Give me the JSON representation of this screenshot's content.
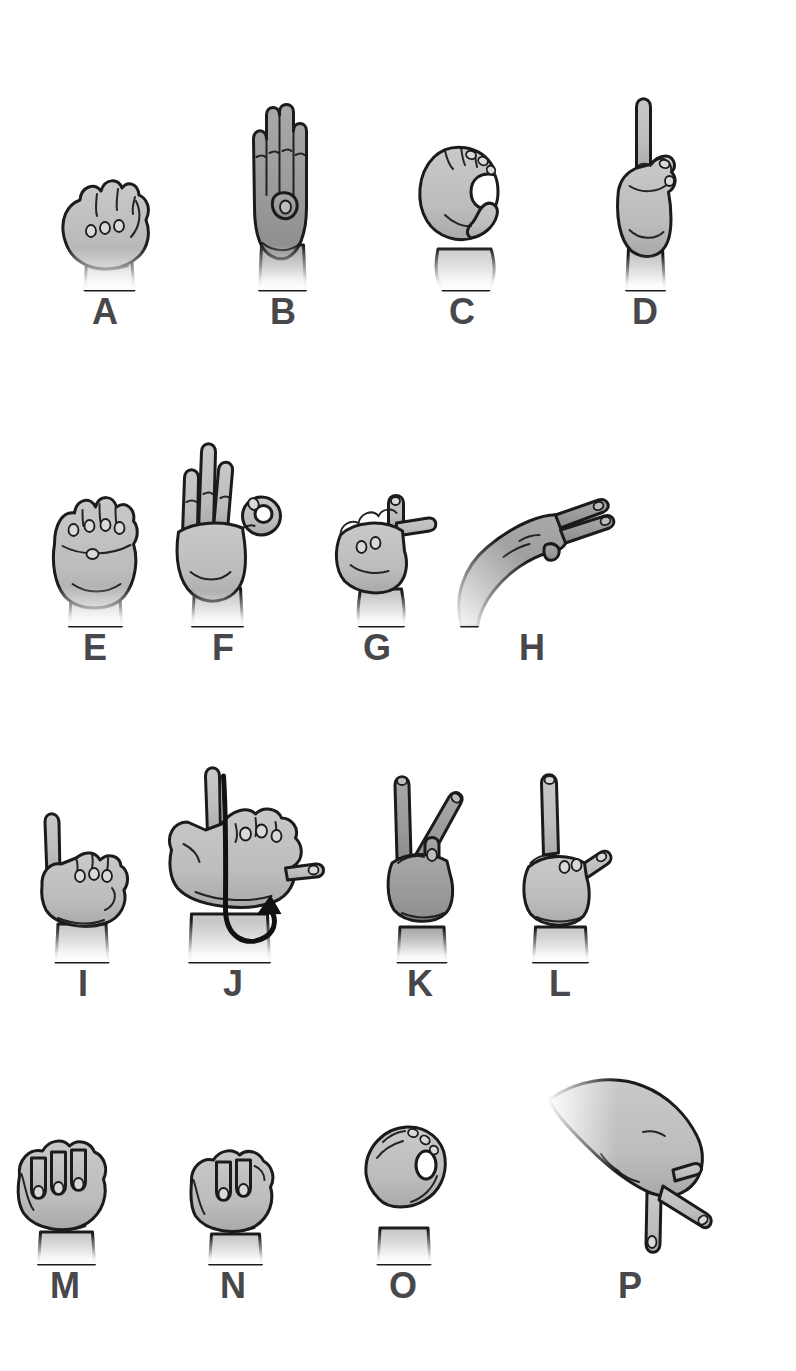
{
  "figure": {
    "kind": "fingerspelling-hand-sign-chart",
    "letters_shown": "A-P"
  },
  "colors": {
    "background": "#ffffff",
    "hand_light": "#c2c2c2",
    "hand_dark": "#9a9a9a",
    "outline": "#1b1b1b",
    "label": "#48484b"
  },
  "rows": [
    {
      "cells": [
        {
          "letter": "A",
          "shade": "light"
        },
        {
          "letter": "B",
          "shade": "dark"
        },
        {
          "letter": "C",
          "shade": "light"
        },
        {
          "letter": "D",
          "shade": "light"
        }
      ]
    },
    {
      "cells": [
        {
          "letter": "E",
          "shade": "light"
        },
        {
          "letter": "F",
          "shade": "light"
        },
        {
          "letter": "G",
          "shade": "light"
        },
        {
          "letter": "H",
          "shade": "dark"
        }
      ]
    },
    {
      "cells": [
        {
          "letter": "I",
          "shade": "light"
        },
        {
          "letter": "J",
          "shade": "light",
          "motion_arrow": true
        },
        {
          "letter": "K",
          "shade": "dark"
        },
        {
          "letter": "L",
          "shade": "light"
        }
      ]
    },
    {
      "cells": [
        {
          "letter": "M",
          "shade": "light"
        },
        {
          "letter": "N",
          "shade": "light"
        },
        {
          "letter": "O",
          "shade": "light"
        },
        {
          "letter": "P",
          "shade": "light"
        }
      ]
    }
  ]
}
